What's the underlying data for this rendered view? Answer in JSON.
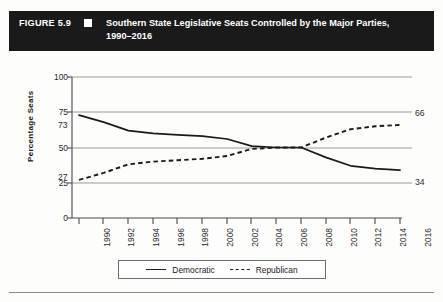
{
  "figure": {
    "number_label": "FIGURE 5.9",
    "title": "Southern State Legislative Seats Controlled by the Major Parties, 1990–2016",
    "banner_color": "#1a1a1a",
    "banner_text_color": "#ffffff",
    "marker_icon": "white-square-icon"
  },
  "legend": {
    "democratic_label": "Democratic",
    "republican_label": "Republican"
  },
  "annotations": {
    "democratic_start": "73",
    "democratic_end": "34",
    "republican_start": "27",
    "republican_end": "66"
  },
  "chart_data": {
    "type": "line",
    "title": "Southern State Legislative Seats Controlled by the Major Parties, 1990–2016",
    "xlabel": "",
    "ylabel": "Percentage Seats",
    "categories": [
      1990,
      1992,
      1994,
      1996,
      1998,
      2000,
      2002,
      2004,
      2006,
      2008,
      2010,
      2012,
      2014,
      2016
    ],
    "x_tick_labels": [
      "1990",
      "1992",
      "1994",
      "1996",
      "1998",
      "2000",
      "2002",
      "2004",
      "2006",
      "2008",
      "2010",
      "2012",
      "2014",
      "2016"
    ],
    "y_tick_labels": [
      "0",
      "25",
      "50",
      "75",
      "100"
    ],
    "y_ticks": [
      0,
      25,
      50,
      75,
      100
    ],
    "ylim": [
      0,
      100
    ],
    "xlim": [
      1990,
      2016
    ],
    "grid": "horizontal",
    "legend_position": "bottom-center",
    "series": [
      {
        "name": "Democratic",
        "style": "solid",
        "color": "#1a1a1a",
        "values": [
          73,
          68,
          62,
          60,
          59,
          58,
          56,
          51,
          50,
          50,
          43,
          37,
          35,
          34
        ]
      },
      {
        "name": "Republican",
        "style": "dashed",
        "color": "#1a1a1a",
        "values": [
          27,
          32,
          38,
          40,
          41,
          42,
          44,
          49,
          50,
          50,
          57,
          63,
          65,
          66
        ]
      }
    ],
    "point_labels": [
      {
        "series": "Democratic",
        "x": 1990,
        "value": 73,
        "text": "73"
      },
      {
        "series": "Democratic",
        "x": 2016,
        "value": 34,
        "text": "34"
      },
      {
        "series": "Republican",
        "x": 1990,
        "value": 27,
        "text": "27"
      },
      {
        "series": "Republican",
        "x": 2016,
        "value": 66,
        "text": "66"
      }
    ]
  }
}
